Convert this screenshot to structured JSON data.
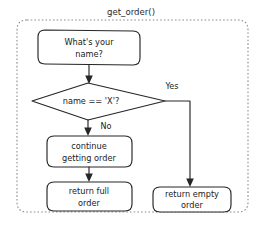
{
  "diagram": {
    "title": "get_order()",
    "type": "flowchart",
    "container": {
      "style": "dashed-rounded-rectangle"
    },
    "nodes": [
      {
        "id": "prompt-name",
        "shape": "rounded-rectangle",
        "lines": [
          "What's your",
          "name?"
        ]
      },
      {
        "id": "name-check",
        "shape": "diamond",
        "lines": [
          "name == 'X'?"
        ]
      },
      {
        "id": "continue-getting-order",
        "shape": "rounded-rectangle",
        "lines": [
          "continue",
          "getting order"
        ]
      },
      {
        "id": "return-full-order",
        "shape": "rounded-rectangle",
        "lines": [
          "return full",
          "order"
        ]
      },
      {
        "id": "return-empty-order",
        "shape": "rounded-rectangle",
        "lines": [
          "return empty",
          "order"
        ]
      }
    ],
    "edges": [
      {
        "id": "prompt-to-check",
        "from": "prompt-name",
        "to": "name-check",
        "label": ""
      },
      {
        "id": "check-yes",
        "from": "name-check",
        "to": "return-empty-order",
        "label": "Yes"
      },
      {
        "id": "check-no",
        "from": "name-check",
        "to": "continue-getting-order",
        "label": "No"
      },
      {
        "id": "continue-to-full",
        "from": "continue-getting-order",
        "to": "return-full-order",
        "label": ""
      }
    ],
    "colors": {
      "background": "#ffffff",
      "stroke": "#262626",
      "container_stroke": "#8d8d8d",
      "text": "#1a1a1a"
    }
  }
}
